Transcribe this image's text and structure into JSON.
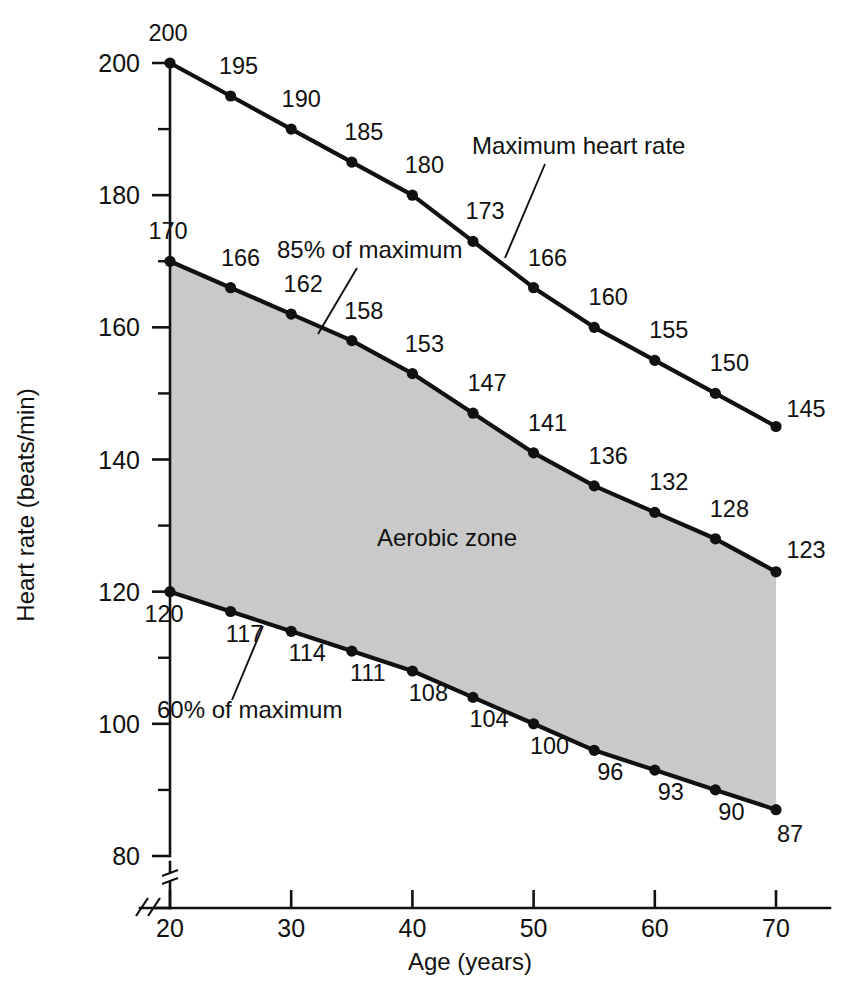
{
  "chart_data": {
    "type": "line",
    "title": "",
    "xlabel": "Age (years)",
    "ylabel": "Heart rate (beats/min)",
    "xlim": [
      20,
      70
    ],
    "ylim": [
      80,
      200
    ],
    "x": [
      20,
      25,
      30,
      35,
      40,
      45,
      50,
      55,
      60,
      65,
      70
    ],
    "x_ticks": [
      20,
      30,
      40,
      50,
      60,
      70
    ],
    "x_tick_labels": [
      "20",
      "30",
      "40",
      "50",
      "60",
      "70"
    ],
    "y_ticks": [
      80,
      100,
      120,
      140,
      160,
      180,
      200
    ],
    "y_tick_labels": [
      "80",
      "100",
      "120",
      "140",
      "160",
      "180",
      "200"
    ],
    "y_minor_ticks": [
      90,
      110,
      130,
      150,
      170,
      190
    ],
    "grid": false,
    "axis_break_x": true,
    "axis_break_y": true,
    "legend_position": "inline-annotations",
    "series": [
      {
        "name": "Maximum heart rate",
        "values": [
          200,
          195,
          190,
          185,
          180,
          173,
          166,
          160,
          155,
          150,
          145
        ],
        "labels": [
          "200",
          "195",
          "190",
          "185",
          "180",
          "173",
          "166",
          "160",
          "155",
          "150",
          "145"
        ]
      },
      {
        "name": "85% of maximum",
        "values": [
          170,
          166,
          162,
          158,
          153,
          147,
          141,
          136,
          132,
          128,
          123
        ],
        "labels": [
          "170",
          "166",
          "162",
          "158",
          "153",
          "147",
          "141",
          "136",
          "132",
          "128",
          "123"
        ]
      },
      {
        "name": "60% of maximum",
        "values": [
          120,
          117,
          114,
          111,
          108,
          104,
          100,
          96,
          93,
          90,
          87
        ],
        "labels": [
          "120",
          "117",
          "114",
          "111",
          "108",
          "104",
          "100",
          "96",
          "93",
          "90",
          "87"
        ]
      }
    ],
    "shaded_region": {
      "label": "Aerobic zone",
      "between": [
        "85% of maximum",
        "60% of maximum"
      ],
      "color": "#c9c9c9"
    },
    "annotations": [
      {
        "name": "maximum-heart-rate",
        "text": "Maximum heart rate"
      },
      {
        "name": "eightyfive-percent",
        "text": "85% of maximum"
      },
      {
        "name": "sixty-percent",
        "text": "60% of maximum"
      },
      {
        "name": "aerobic-zone",
        "text": "Aerobic zone"
      }
    ],
    "colors": {
      "line": "#111111",
      "zone_fill": "#c9c9c9",
      "background": "#ffffff"
    }
  },
  "axes": {
    "x_title": "Age (years)",
    "y_title": "Heart rate (beats/min)"
  }
}
